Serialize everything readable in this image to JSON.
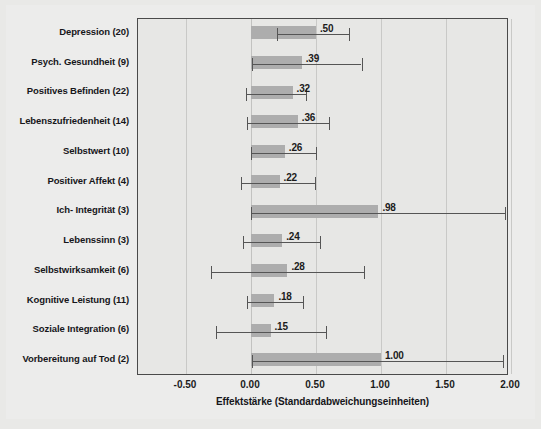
{
  "chart_data": {
    "type": "bar",
    "orientation": "horizontal",
    "title": "",
    "xlabel": "Effektstärke (Standardabweichungseinheiten)",
    "ylabel": "",
    "xlim": [
      -0.8,
      2.05
    ],
    "xticks": [
      -0.5,
      0.0,
      0.5,
      1.0,
      1.5,
      2.0
    ],
    "xticklabels": [
      "-0.50",
      "0.00",
      "0.50",
      "1.00",
      "1.50",
      "2.00"
    ],
    "grid": true,
    "legend": null,
    "value_label_format": ".NN (leading zero omitted)",
    "categories": [
      "Depression (20)",
      "Psych. Gesundheit (9)",
      "Positives Befinden (22)",
      "Lebenszufriedenheit (14)",
      "Selbstwert (10)",
      "Positiver Affekt (4)",
      "Ich- Integrität (3)",
      "Lebenssinn (3)",
      "Selbstwirksamkeit (6)",
      "Kognitive Leistung (11)",
      "Soziale Integration (6)",
      "Vorbereitung auf Tod (2)"
    ],
    "values": [
      0.5,
      0.39,
      0.32,
      0.36,
      0.26,
      0.22,
      0.98,
      0.24,
      0.28,
      0.18,
      0.15,
      1.0
    ],
    "value_labels": [
      ".50",
      ".39",
      ".32",
      ".36",
      ".26",
      ".22",
      ".98",
      ".24",
      ".28",
      ".18",
      ".15",
      "1.00"
    ],
    "error_low": [
      0.2,
      0.01,
      -0.04,
      -0.03,
      0.0,
      -0.08,
      0.0,
      -0.06,
      -0.31,
      -0.03,
      -0.27,
      0.01
    ],
    "error_high": [
      0.75,
      0.85,
      0.42,
      0.6,
      0.5,
      0.49,
      1.95,
      0.53,
      0.87,
      0.4,
      0.58,
      1.94
    ],
    "bars": [
      {
        "category": "Depression (20)",
        "value": 0.5,
        "label": ".50",
        "ci_low": 0.2,
        "ci_high": 0.75
      },
      {
        "category": "Psych. Gesundheit (9)",
        "value": 0.39,
        "label": ".39",
        "ci_low": 0.01,
        "ci_high": 0.85
      },
      {
        "category": "Positives Befinden (22)",
        "value": 0.32,
        "label": ".32",
        "ci_low": -0.04,
        "ci_high": 0.42
      },
      {
        "category": "Lebenszufriedenheit (14)",
        "value": 0.36,
        "label": ".36",
        "ci_low": -0.03,
        "ci_high": 0.6
      },
      {
        "category": "Selbstwert (10)",
        "value": 0.26,
        "label": ".26",
        "ci_low": 0.0,
        "ci_high": 0.5
      },
      {
        "category": "Positiver Affekt (4)",
        "value": 0.22,
        "label": ".22",
        "ci_low": -0.08,
        "ci_high": 0.49
      },
      {
        "category": "Ich- Integrität (3)",
        "value": 0.98,
        "label": ".98",
        "ci_low": 0.0,
        "ci_high": 1.95
      },
      {
        "category": "Lebenssinn (3)",
        "value": 0.24,
        "label": ".24",
        "ci_low": -0.06,
        "ci_high": 0.53
      },
      {
        "category": "Selbstwirksamkeit (6)",
        "value": 0.28,
        "label": ".28",
        "ci_low": -0.31,
        "ci_high": 0.87
      },
      {
        "category": "Kognitive Leistung (11)",
        "value": 0.18,
        "label": ".18",
        "ci_low": -0.03,
        "ci_high": 0.4
      },
      {
        "category": "Soziale Integration (6)",
        "value": 0.15,
        "label": ".15",
        "ci_low": -0.27,
        "ci_high": 0.58
      },
      {
        "category": "Vorbereitung auf Tod (2)",
        "value": 1.0,
        "label": "1.00",
        "ci_low": 0.01,
        "ci_high": 1.94
      }
    ],
    "colors": {
      "bar_fill": "#adadad",
      "error_bar": "#555555",
      "plot_background": "#e7e7e5",
      "figure_background": "#ececeb",
      "frame": "#4a4a4a",
      "gridline": "#c9c9c7",
      "text": "#16161a"
    }
  }
}
